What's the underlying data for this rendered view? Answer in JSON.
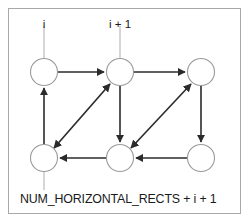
{
  "figure": {
    "type": "directed-graph-diagram",
    "background_color": "#ffffff",
    "frame_color": "#a8a8a8",
    "node_stroke_color": "#9a9a9a",
    "edge_color": "#2b2b2b",
    "leader_color": "#b4b4b4",
    "labels": {
      "top_left": "i",
      "top_right": "i + 1",
      "bottom_caption": "NUM_HORIZONTAL_RECTS + i + 1"
    },
    "nodes": [
      {
        "id": "n0",
        "row": "top",
        "col": 0,
        "cx": 44,
        "cy": 72,
        "r": 13.5
      },
      {
        "id": "n1",
        "row": "top",
        "col": 1,
        "cx": 120,
        "cy": 72,
        "r": 13.5
      },
      {
        "id": "n2",
        "row": "top",
        "col": 2,
        "cx": 201,
        "cy": 72,
        "r": 13.5
      },
      {
        "id": "n3",
        "row": "bottom",
        "col": 0,
        "cx": 44,
        "cy": 158,
        "r": 13.5
      },
      {
        "id": "n4",
        "row": "bottom",
        "col": 1,
        "cx": 120,
        "cy": 158,
        "r": 13.5
      },
      {
        "id": "n5",
        "row": "bottom",
        "col": 2,
        "cx": 201,
        "cy": 158,
        "r": 13.5
      }
    ],
    "edges": [
      {
        "from": "n0",
        "to": "n1",
        "direction": "right",
        "kind": "horizontal"
      },
      {
        "from": "n1",
        "to": "n2",
        "direction": "right",
        "kind": "horizontal"
      },
      {
        "from": "n4",
        "to": "n3",
        "direction": "left",
        "kind": "horizontal"
      },
      {
        "from": "n5",
        "to": "n4",
        "direction": "left",
        "kind": "horizontal"
      },
      {
        "from": "n3",
        "to": "n0",
        "direction": "up",
        "kind": "vertical"
      },
      {
        "from": "n1",
        "to": "n4",
        "direction": "down",
        "kind": "vertical"
      },
      {
        "from": "n2",
        "to": "n5",
        "direction": "down",
        "kind": "vertical"
      },
      {
        "from": "n3",
        "to": "n1",
        "direction": "both",
        "kind": "diagonal"
      },
      {
        "from": "n4",
        "to": "n2",
        "direction": "both",
        "kind": "diagonal"
      }
    ],
    "leaders": [
      {
        "label": "i",
        "from_x": 44,
        "from_y": 24,
        "to_x": 44,
        "to_y": 58
      },
      {
        "label": "i + 1",
        "from_x": 120,
        "from_y": 24,
        "to_x": 120,
        "to_y": 58
      },
      {
        "label": "NUM_HORIZONTAL_RECTS + i + 1",
        "from_x": 44,
        "from_y": 172,
        "to_x": 44,
        "to_y": 192
      }
    ]
  }
}
